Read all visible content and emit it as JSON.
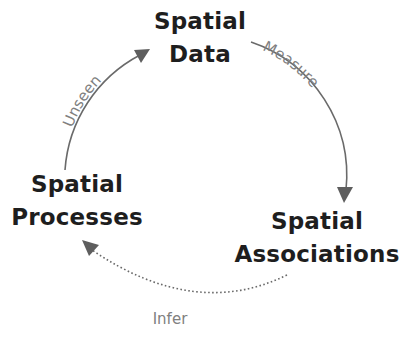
{
  "nodes": {
    "spatial_data": {
      "line1": "Spatial",
      "line2": "Data"
    },
    "spatial_processes": {
      "line1": "Spatial",
      "line2": "Processes"
    },
    "spatial_associations": {
      "line1": "Spatial",
      "line2": "Associations"
    }
  },
  "edges": {
    "measure": {
      "label": "Measure",
      "from": "Spatial Data",
      "to": "Spatial Associations",
      "style": "solid"
    },
    "infer": {
      "label": "Infer",
      "from": "Spatial Associations",
      "to": "Spatial Processes",
      "style": "dotted"
    },
    "unseen": {
      "label": "Unseen",
      "from": "Spatial Processes",
      "to": "Spatial Data",
      "style": "solid"
    }
  },
  "colors": {
    "node_text": "#1e1e1e",
    "edge_line": "#6a6a6a",
    "edge_label": "#808080",
    "background": "#ffffff"
  }
}
